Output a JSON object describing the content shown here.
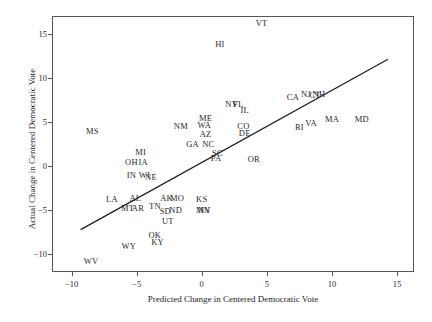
{
  "chart_data": {
    "type": "scatter",
    "title": "",
    "xlabel": "Predicted Change in Centered Democratic Vote",
    "ylabel": "Actual Change in Centered Democratic Vote",
    "xlim": [
      -11.5,
      16.3
    ],
    "ylim": [
      -12.0,
      17.0
    ],
    "grid": false,
    "legend": "none",
    "point_style": "text-label-only",
    "xticks": [
      -10,
      -5,
      0,
      5,
      10,
      15
    ],
    "xtick_labels": [
      "−10",
      "−5",
      "0",
      "5",
      "10",
      "15"
    ],
    "yticks": [
      -10,
      -5,
      0,
      5,
      10,
      15
    ],
    "ytick_labels": [
      "−10",
      "−5",
      "0",
      "5",
      "10",
      "15"
    ],
    "reference_line": {
      "label": "45-degree fit line",
      "x_start": -9.3,
      "y_start": -7.2,
      "x_end": 14.3,
      "y_end": 12.1
    },
    "points": [
      {
        "label": "VT",
        "x": 4.6,
        "y": 16.2
      },
      {
        "label": "HI",
        "x": 1.4,
        "y": 13.8
      },
      {
        "label": "NH",
        "x": 9.0,
        "y": 8.2
      },
      {
        "label": "NJ",
        "x": 8.0,
        "y": 8.2
      },
      {
        "label": "CT",
        "x": 8.7,
        "y": 8.1
      },
      {
        "label": "CA",
        "x": 7.0,
        "y": 7.8
      },
      {
        "label": "NV",
        "x": 2.3,
        "y": 7.0
      },
      {
        "label": "FL",
        "x": 2.8,
        "y": 7.0
      },
      {
        "label": "IL",
        "x": 3.3,
        "y": 6.3
      },
      {
        "label": "ME",
        "x": 0.3,
        "y": 5.4
      },
      {
        "label": "MD",
        "x": 12.3,
        "y": 5.3
      },
      {
        "label": "MA",
        "x": 10.0,
        "y": 5.3
      },
      {
        "label": "VA",
        "x": 8.4,
        "y": 4.9
      },
      {
        "label": "WA",
        "x": 0.2,
        "y": 4.6
      },
      {
        "label": "NM",
        "x": -1.6,
        "y": 4.5
      },
      {
        "label": "CO",
        "x": 3.2,
        "y": 4.5
      },
      {
        "label": "RI",
        "x": 7.5,
        "y": 4.4
      },
      {
        "label": "DE",
        "x": 3.3,
        "y": 3.7
      },
      {
        "label": "AZ",
        "x": 0.3,
        "y": 3.6
      },
      {
        "label": "GA",
        "x": -0.7,
        "y": 2.5
      },
      {
        "label": "NC",
        "x": 0.5,
        "y": 2.5
      },
      {
        "label": "MS",
        "x": -8.4,
        "y": 4.0
      },
      {
        "label": "MI",
        "x": -4.7,
        "y": 1.6
      },
      {
        "label": "SC",
        "x": 1.2,
        "y": 1.5
      },
      {
        "label": "PA",
        "x": 1.1,
        "y": 0.9
      },
      {
        "label": "OR",
        "x": 4.0,
        "y": 0.8
      },
      {
        "label": "OH",
        "x": -5.4,
        "y": 0.5
      },
      {
        "label": "IA",
        "x": -4.5,
        "y": 0.5
      },
      {
        "label": "IN",
        "x": -5.4,
        "y": -1.0
      },
      {
        "label": "WI",
        "x": -4.4,
        "y": -1.0
      },
      {
        "label": "NE",
        "x": -3.9,
        "y": -1.2
      },
      {
        "label": "LA",
        "x": -6.9,
        "y": -3.7
      },
      {
        "label": "AL",
        "x": -5.1,
        "y": -3.6
      },
      {
        "label": "AK",
        "x": -2.7,
        "y": -3.6
      },
      {
        "label": "MO",
        "x": -1.9,
        "y": -3.6
      },
      {
        "label": "KS",
        "x": 0.0,
        "y": -3.7
      },
      {
        "label": "MT",
        "x": -5.7,
        "y": -4.7
      },
      {
        "label": "AR",
        "x": -4.9,
        "y": -4.8
      },
      {
        "label": "TN",
        "x": -3.6,
        "y": -4.5
      },
      {
        "label": "SD",
        "x": -2.8,
        "y": -5.1
      },
      {
        "label": "ND",
        "x": -2.0,
        "y": -5.0
      },
      {
        "label": "MN",
        "x": 0.1,
        "y": -5.0
      },
      {
        "label": "NV2",
        "x": 0.2,
        "y": -5.0
      },
      {
        "label": "UT",
        "x": -2.6,
        "y": -6.2
      },
      {
        "label": "OK",
        "x": -3.6,
        "y": -7.8
      },
      {
        "label": "KY",
        "x": -3.4,
        "y": -8.6
      },
      {
        "label": "WY",
        "x": -5.6,
        "y": -9.0
      },
      {
        "label": "WV",
        "x": -8.5,
        "y": -10.7
      }
    ]
  }
}
